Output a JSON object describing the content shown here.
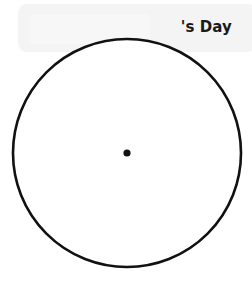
{
  "canvas": {
    "width": 252,
    "height": 281,
    "background": "#ffffff"
  },
  "banner": {
    "title": "'s Day",
    "background_color": "#f4f4f4",
    "text_color": "#1a1a1a",
    "ghost_block_color": "#f7f7f7"
  },
  "figure": {
    "type": "circle-with-center-point",
    "stroke_color": "#111111",
    "fill_color": "#ffffff",
    "point_color": "#111111",
    "circle": {
      "center_x": 127,
      "center_y": 153,
      "radius": 114,
      "stroke_width": 2.6
    },
    "center_point": {
      "x": 127,
      "y": 153,
      "radius": 3.6
    }
  }
}
